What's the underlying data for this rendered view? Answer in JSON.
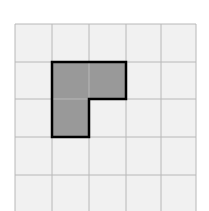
{
  "diagram": {
    "type": "grid-shape",
    "grid": {
      "columns": 5,
      "rows_visible": 5,
      "cell_size": 37,
      "origin_x": 15,
      "origin_y": 24,
      "line_color": "#b8b8b8",
      "cell_fill": "#f1f1f1"
    },
    "shape": {
      "name": "L-shaped figure",
      "cells": [
        [
          1,
          1
        ],
        [
          2,
          1
        ],
        [
          1,
          2
        ]
      ],
      "fill": "#999999",
      "stroke": "#000000"
    }
  }
}
